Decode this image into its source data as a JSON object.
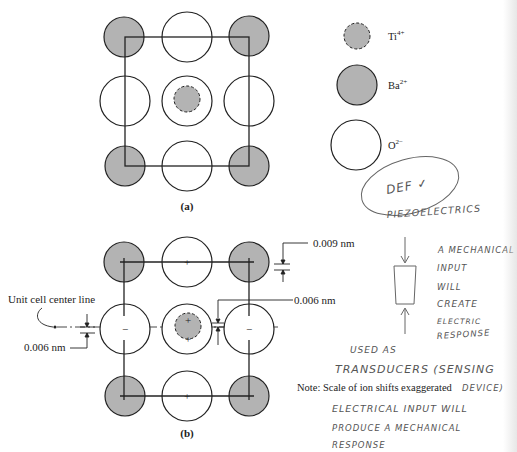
{
  "colors": {
    "ba_fill": "#b3b3b3",
    "ti_fill": "#b3b3b3",
    "o_fill": "#ffffff",
    "stroke": "#222222",
    "handwriting": "#555555"
  },
  "figure_a": {
    "caption": "(a)",
    "cell_square": {
      "x": 125,
      "y": 37,
      "w": 124,
      "h": 129
    },
    "ions": [
      {
        "type": "Ba",
        "cx": 124,
        "cy": 37,
        "r": 20
      },
      {
        "type": "O",
        "cx": 187,
        "cy": 37,
        "r": 25
      },
      {
        "type": "Ba",
        "cx": 249,
        "cy": 36,
        "r": 20
      },
      {
        "type": "O",
        "cx": 125,
        "cy": 101,
        "r": 25
      },
      {
        "type": "O",
        "cx": 187,
        "cy": 101,
        "r": 25
      },
      {
        "type": "Ti",
        "cx": 187,
        "cy": 99,
        "r": 13
      },
      {
        "type": "O",
        "cx": 249,
        "cy": 101,
        "r": 25
      },
      {
        "type": "Ba",
        "cx": 125,
        "cy": 166,
        "r": 20
      },
      {
        "type": "O",
        "cx": 187,
        "cy": 166,
        "r": 25
      },
      {
        "type": "Ba",
        "cx": 249,
        "cy": 166,
        "r": 20
      }
    ]
  },
  "legend": {
    "items": [
      {
        "ion": "Ti",
        "label": "Ti",
        "charge": "4+",
        "cx": 357,
        "cy": 36,
        "r": 13,
        "dashed": true
      },
      {
        "ion": "Ba",
        "label": "Ba",
        "charge": "2+",
        "cx": 357,
        "cy": 85,
        "r": 20,
        "dashed": false
      },
      {
        "ion": "O",
        "label": "O",
        "charge": "2−",
        "cx": 356,
        "cy": 145,
        "r": 25,
        "dashed": false
      }
    ]
  },
  "figure_b": {
    "caption": "(b)",
    "center_line_label": "Unit cell center line",
    "dim_top_label": "0.009 nm",
    "dim_mid_label": "0.006 nm",
    "dim_left_label": "0.006 nm",
    "note": "Note:  Scale of ion shifts exaggerated",
    "ions": [
      {
        "type": "Ba",
        "cx": 124,
        "cy": 262,
        "r": 20,
        "mark": ""
      },
      {
        "type": "O",
        "cx": 187,
        "cy": 262,
        "r": 25,
        "mark": "+"
      },
      {
        "type": "Ba",
        "cx": 249,
        "cy": 262,
        "r": 20,
        "mark": ""
      },
      {
        "type": "O",
        "cx": 125,
        "cy": 329,
        "r": 25,
        "mark": "−"
      },
      {
        "type": "O",
        "cx": 187,
        "cy": 329,
        "r": 25,
        "mark": ""
      },
      {
        "type": "Ti",
        "cx": 188,
        "cy": 326,
        "r": 13,
        "mark": "+"
      },
      {
        "type": "O",
        "cx": 249,
        "cy": 329,
        "r": 25,
        "mark": "−"
      },
      {
        "type": "Ba",
        "cx": 125,
        "cy": 396,
        "r": 20,
        "mark": ""
      },
      {
        "type": "O",
        "cx": 187,
        "cy": 396,
        "r": 25,
        "mark": "+"
      },
      {
        "type": "Ba",
        "cx": 249,
        "cy": 396,
        "r": 20,
        "mark": ""
      }
    ]
  },
  "handwritten_notes": {
    "circled": "DEF ✓",
    "title": "PIEZOELECTRICS",
    "mechanical_lines": [
      "A MECHANICAL",
      "INPUT",
      "WILL",
      "CREATE",
      "ELECTRIC",
      "RESPONSE"
    ],
    "used_as": "USED AS",
    "transducers": "TRANSDUCERS (SENSING",
    "device": "DEVICE)",
    "electrical_lines": [
      "ELECTRICAL INPUT WILL",
      "PRODUCE A MECHANICAL",
      "RESPONSE"
    ]
  }
}
